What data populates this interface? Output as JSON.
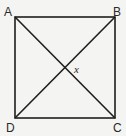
{
  "diagram": {
    "type": "square-with-diagonals",
    "vertices": {
      "A": {
        "label": "A",
        "position": "top-left"
      },
      "B": {
        "label": "B",
        "position": "top-right"
      },
      "C": {
        "label": "C",
        "position": "bottom-right"
      },
      "D": {
        "label": "D",
        "position": "bottom-left"
      }
    },
    "diagonals": [
      "AC",
      "BD"
    ],
    "angle_label": "x",
    "colors": {
      "line": "#1e1e1e",
      "background": "#f4f4f2",
      "text": "#2a2a2a"
    }
  }
}
